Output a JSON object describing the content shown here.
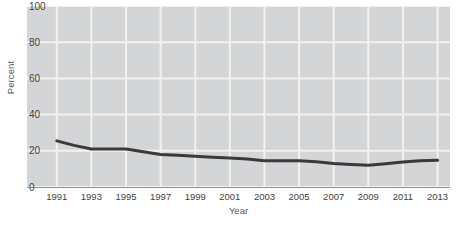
{
  "chart_data": {
    "type": "line",
    "title": "",
    "xlabel": "Year",
    "ylabel": "Percent",
    "x": [
      1991,
      1992,
      1993,
      1994,
      1995,
      1996,
      1997,
      1998,
      1999,
      2000,
      2001,
      2002,
      2003,
      2004,
      2005,
      2006,
      2007,
      2008,
      2009,
      2010,
      2011,
      2012,
      2013
    ],
    "values": [
      25.5,
      23.0,
      21.0,
      21.0,
      21.0,
      19.5,
      18.0,
      17.5,
      17.0,
      16.5,
      16.0,
      15.5,
      14.5,
      14.5,
      14.5,
      14.0,
      13.0,
      12.5,
      12.0,
      12.8,
      13.8,
      14.5,
      14.8
    ],
    "series": [
      {
        "name": "Percent",
        "color": "#3a3a3c",
        "values": [
          25.5,
          23.0,
          21.0,
          21.0,
          21.0,
          19.5,
          18.0,
          17.5,
          17.0,
          16.5,
          16.0,
          15.5,
          14.5,
          14.5,
          14.5,
          14.0,
          13.0,
          12.5,
          12.0,
          12.8,
          13.8,
          14.5,
          14.8
        ]
      }
    ],
    "xticks": [
      "1991",
      "1993",
      "1995",
      "1997",
      "1999",
      "2001",
      "2003",
      "2005",
      "2007",
      "2009",
      "2011",
      "2013"
    ],
    "xtick_values": [
      1991,
      1993,
      1995,
      1997,
      1999,
      2001,
      2003,
      2005,
      2007,
      2009,
      2011,
      2013
    ],
    "yticks": [
      "0",
      "20",
      "40",
      "60",
      "80",
      "100"
    ],
    "ytick_values": [
      0,
      20,
      40,
      60,
      80,
      100
    ],
    "xlim": [
      1990,
      1991,
      2013,
      2014
    ],
    "ylim": [
      0,
      100
    ],
    "grid": true,
    "legend": "none",
    "plot_background": "#d4d5d6",
    "grid_color": "#f2f2f2",
    "line_color": "#3a3a3c",
    "line_width": 3,
    "axis_color": "#8e9092",
    "page_background": "#ffffff"
  }
}
